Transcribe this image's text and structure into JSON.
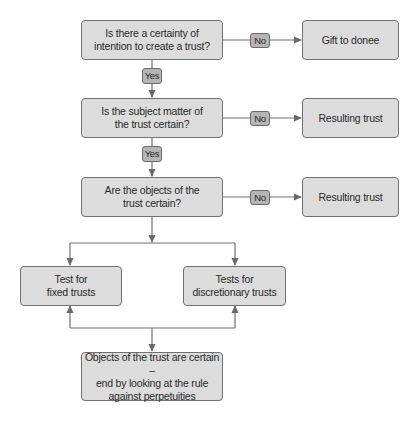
{
  "diagram": {
    "type": "flowchart",
    "colors": {
      "box_fill": "#dcdcdc",
      "box_border": "#707070",
      "tag_fill": "#b5b5b5",
      "line": "#707070"
    },
    "nodes": {
      "q_intention": "Is there a certainty of\nintention to create a trust?",
      "gift_to_donee": "Gift to donee",
      "q_subject_matter": "Is the subject matter of\nthe trust certain?",
      "resulting_trust_1": "Resulting trust",
      "q_objects": "Are the objects of the\ntrust certain?",
      "resulting_trust_2": "Resulting trust",
      "fixed_trusts": "Test for\nfixed trusts",
      "discretionary_trusts": "Tests for\ndiscretionary trusts",
      "objects_certain": "Objects of the trust are certain –\nend by looking at the rule\nagainst perpetuities"
    },
    "edge_labels": {
      "no_1": "No",
      "yes_1": "Yes",
      "no_2": "No",
      "yes_2": "Yes",
      "no_3": "No"
    },
    "edges": [
      {
        "from": "q_intention",
        "to": "gift_to_donee",
        "label": "No"
      },
      {
        "from": "q_intention",
        "to": "q_subject_matter",
        "label": "Yes"
      },
      {
        "from": "q_subject_matter",
        "to": "resulting_trust_1",
        "label": "No"
      },
      {
        "from": "q_subject_matter",
        "to": "q_objects",
        "label": "Yes"
      },
      {
        "from": "q_objects",
        "to": "resulting_trust_2",
        "label": "No"
      },
      {
        "from": "q_objects",
        "to": "fixed_trusts"
      },
      {
        "from": "q_objects",
        "to": "discretionary_trusts"
      },
      {
        "from": "objects_certain",
        "to": "fixed_trusts"
      },
      {
        "from": "objects_certain",
        "to": "discretionary_trusts"
      }
    ]
  }
}
